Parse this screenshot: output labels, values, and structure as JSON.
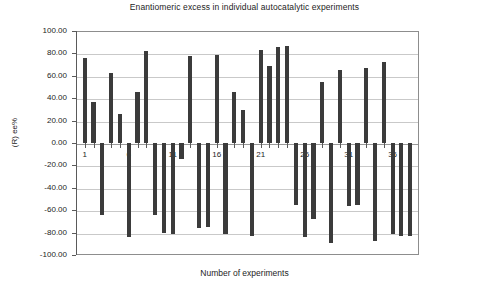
{
  "chart_data": {
    "type": "bar",
    "title": "Enantiomeric excess in individual autocatalytic experiments",
    "xlabel": "Number of experiments",
    "ylabel": "(R) ee%",
    "ylim": [
      -100,
      100
    ],
    "ytick_step": 20,
    "ytick_labels": [
      "100.00",
      "80.00",
      "60.00",
      "40.00",
      "20.00",
      "0.00",
      "-20.00",
      "-40.00",
      "-60.00",
      "-80.00",
      "-100.00"
    ],
    "ytick_values": [
      100,
      80,
      60,
      40,
      20,
      0,
      -20,
      -40,
      -60,
      -80,
      -100
    ],
    "xtick_labels": [
      "1",
      "6",
      "11",
      "16",
      "21",
      "26",
      "31",
      "36"
    ],
    "xtick_values": [
      1,
      6,
      11,
      16,
      21,
      26,
      31,
      36
    ],
    "xlim": [
      0,
      39
    ],
    "grid": true,
    "legend": "none",
    "bar_color": "#3b3b3b",
    "categories": [
      1,
      2,
      3,
      4,
      5,
      6,
      7,
      8,
      9,
      10,
      11,
      12,
      13,
      14,
      15,
      16,
      17,
      18,
      19,
      20,
      21,
      22,
      23,
      24,
      25,
      26,
      27,
      28,
      29,
      30,
      31,
      32,
      33,
      34,
      35,
      36,
      37,
      38
    ],
    "values": [
      75.8,
      36.6,
      -64.3,
      62.6,
      26.1,
      -83.5,
      45.6,
      82.3,
      -64.5,
      -80.6,
      -80.9,
      -14.7,
      77.9,
      -75.6,
      -74.6,
      78.4,
      -81.2,
      45.7,
      29.6,
      -83.0,
      82.8,
      68.4,
      85.7,
      86.9,
      -55.3,
      -83.8,
      -67.8,
      54.9,
      -89.5,
      65.0,
      -55.9,
      -55.7,
      67.2,
      -87.9,
      72.2,
      -81.3,
      -83.4,
      -83.4
    ],
    "series_name": "(R) ee%"
  },
  "axes": {
    "y_title": "(R) ee%",
    "x_title": "Number of experiments"
  }
}
